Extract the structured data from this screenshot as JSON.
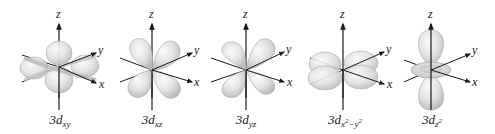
{
  "figure": {
    "orbitals": [
      {
        "id": "dxy",
        "label_prefix": "3d",
        "subscript": "xy",
        "sup": "",
        "sub2": "",
        "cx": 59,
        "cy": 62
      },
      {
        "id": "dxz",
        "label_prefix": "3d",
        "subscript": "xz",
        "sup": "",
        "sub2": "",
        "cx": 152,
        "cy": 68
      },
      {
        "id": "dyz",
        "label_prefix": "3d",
        "subscript": "yz",
        "sup": "",
        "sub2": "",
        "cx": 246,
        "cy": 68
      },
      {
        "id": "dx2y2",
        "label_prefix": "3d",
        "subscript": "x",
        "sup": "2",
        "sub2": "−y",
        "sup2": "2",
        "cx": 343,
        "cy": 70
      },
      {
        "id": "dz2",
        "label_prefix": "3d",
        "subscript": "z",
        "sup": "2",
        "sub2": "",
        "cx": 431,
        "cy": 70
      }
    ],
    "axis_labels": {
      "x": "x",
      "y": "y",
      "z": "z"
    },
    "colors": {
      "lobe_fill": "#d9d9d9",
      "lobe_edge": "#a8a8a8",
      "axis": "#1a1a1a",
      "background": "#ffffff"
    }
  }
}
